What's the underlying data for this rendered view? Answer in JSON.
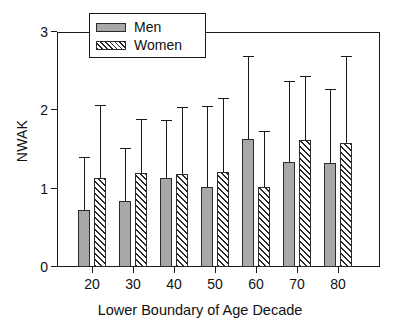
{
  "chart_data": {
    "type": "bar",
    "title": "",
    "xlabel": "Lower Boundary of Age Decade",
    "ylabel": "NWAK",
    "categories": [
      "20",
      "30",
      "40",
      "50",
      "60",
      "70",
      "80"
    ],
    "ylim": [
      0,
      3
    ],
    "yticks": [
      "0",
      "1",
      "2",
      "3"
    ],
    "grid": false,
    "legend_position": "top-center",
    "error_bars": "upper-only",
    "series": [
      {
        "name": "Men",
        "color": "#a8a8a8",
        "pattern": "solid",
        "values": [
          0.73,
          0.84,
          1.14,
          1.02,
          1.64,
          1.34,
          1.33
        ],
        "error_upper": [
          1.4,
          1.52,
          1.88,
          2.06,
          2.69,
          2.38,
          2.27
        ]
      },
      {
        "name": "Women",
        "color": "#2b2b2b",
        "pattern": "diagonal-hatch",
        "values": [
          1.14,
          1.2,
          1.19,
          1.21,
          1.02,
          1.62,
          1.58
        ],
        "error_upper": [
          2.07,
          1.89,
          2.04,
          2.16,
          1.73,
          2.44,
          2.69
        ]
      }
    ]
  },
  "legend": {
    "items": [
      {
        "label": "Men",
        "swatch": "men-swatch"
      },
      {
        "label": "Women",
        "swatch": "women-swatch"
      }
    ]
  }
}
